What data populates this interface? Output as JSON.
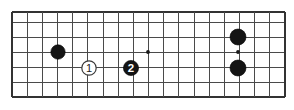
{
  "figure": {
    "kind": "go-board-diagram",
    "title": "",
    "background_color": "#ffffff"
  },
  "board": {
    "left": 12,
    "top": 12,
    "right": 285,
    "bottom": 97,
    "columns": 19,
    "rows": 6,
    "column_spacing": 15.17,
    "row_spacing": 15.0,
    "first_row_y": 22,
    "line_color": "#4a4a4a",
    "edge_color": "#333333"
  },
  "star_points": [
    {
      "name": "star-point-center-left",
      "x": 148,
      "y": 52
    },
    {
      "name": "star-point-center-right",
      "x": 238,
      "y": 52
    }
  ],
  "stones": [
    {
      "name": "black-stone-left",
      "color": "black",
      "label": "",
      "x": 58,
      "y": 52,
      "radius": 7.2
    },
    {
      "name": "white-stone-move-1",
      "color": "white",
      "label": "1",
      "x": 89,
      "y": 68,
      "radius": 7.2
    },
    {
      "name": "black-stone-move-2",
      "color": "black",
      "label": "2",
      "x": 131,
      "y": 68,
      "radius": 7.6
    },
    {
      "name": "black-stone-upper-right",
      "color": "black",
      "label": "",
      "x": 238,
      "y": 37,
      "radius": 8.0
    },
    {
      "name": "black-stone-lower-right",
      "color": "black",
      "label": "",
      "x": 238,
      "y": 68,
      "radius": 8.0
    }
  ],
  "colors": {
    "black_stone": "#141414",
    "white_stone": "#ffffff",
    "white_stone_outline": "#3a3a3a",
    "grid": "#4a4a4a",
    "edge": "#333333",
    "label_on_black": "#ffffff",
    "label_on_white": "#222222"
  }
}
